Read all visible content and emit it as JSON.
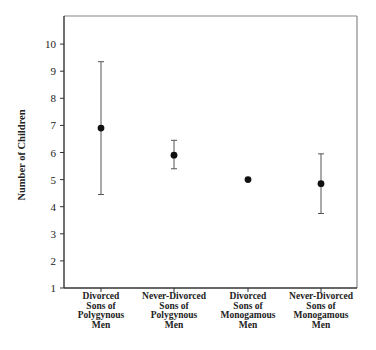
{
  "chart_data": {
    "type": "scatter",
    "subtype": "point-with-error-bars",
    "title": "",
    "xlabel": "",
    "ylabel": "Number of Children",
    "ylim": [
      1,
      11
    ],
    "yticks": [
      1,
      2,
      3,
      4,
      5,
      6,
      7,
      8,
      9,
      10
    ],
    "grid": false,
    "legend": null,
    "categories": [
      [
        "Divorced",
        "Sons of",
        "Polygynous",
        "Men"
      ],
      [
        "Never-Divorced",
        "Sons of",
        "Polygynous",
        "Men"
      ],
      [
        "Divorced",
        "Sons of",
        "Monogamous",
        "Men"
      ],
      [
        "Never-Divorced",
        "Sons of",
        "Monogamous",
        "Men"
      ]
    ],
    "category_names": [
      "Divorced Sons of Polygynous Men",
      "Never-Divorced Sons of Polygynous Men",
      "Divorced Sons of Monogamous Men",
      "Never-Divorced Sons of Monogamous Men"
    ],
    "values": [
      6.9,
      5.9,
      5.0,
      4.85
    ],
    "error_upper": [
      9.35,
      6.45,
      null,
      5.95
    ],
    "error_lower": [
      4.45,
      5.4,
      null,
      3.75
    ]
  },
  "style": {
    "axis_color": "#333333",
    "frame_color": "#888888",
    "marker_color": "#111111",
    "errorbar_color": "#555555"
  }
}
